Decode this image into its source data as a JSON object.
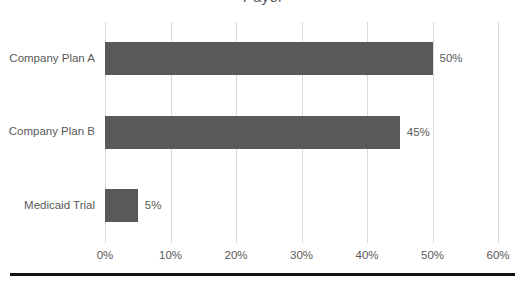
{
  "chart_data": {
    "type": "bar",
    "orientation": "horizontal",
    "title": "Payer",
    "xlabel": "",
    "ylabel": "",
    "categories": [
      "Company Plan A",
      "Company Plan B",
      "Medicaid Trial"
    ],
    "values": [
      50,
      45,
      5
    ],
    "data_labels": [
      "50%",
      "45%",
      "5%"
    ],
    "xlim": [
      0,
      60
    ],
    "xticks": [
      0,
      10,
      20,
      30,
      40,
      50,
      60
    ],
    "xtick_labels": [
      "0%",
      "10%",
      "20%",
      "30%",
      "40%",
      "50%",
      "60%"
    ],
    "grid": true,
    "grid_axis": "x",
    "legend": false,
    "series": [
      {
        "name": "Payer",
        "values": [
          50,
          45,
          5
        ]
      }
    ]
  },
  "style": {
    "bar_color": "#595959",
    "grid_color": "#d9d9d9",
    "text_color": "#595959",
    "title_color": "#585858",
    "rule_color": "#111111",
    "background": "#ffffff"
  }
}
